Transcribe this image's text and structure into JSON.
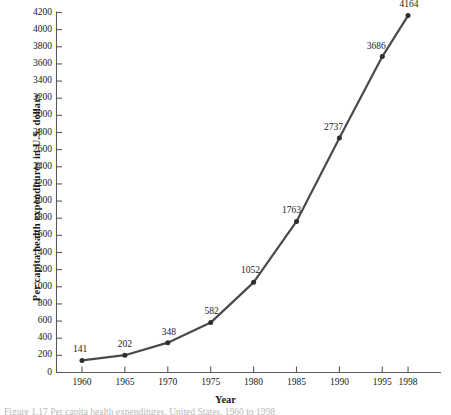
{
  "figure": {
    "caption": "Figure 1.17 Per capita health expenditures, United States, 1960 to 1998"
  },
  "chart_data": {
    "type": "line",
    "title": "",
    "xlabel": "Year",
    "ylabel": "Per capita health expenditures in U.S. dollars",
    "categories": [
      "1960",
      "1965",
      "1970",
      "1975",
      "1980",
      "1985",
      "1990",
      "1995",
      "1998"
    ],
    "x": [
      1960,
      1965,
      1970,
      1975,
      1980,
      1985,
      1990,
      1995,
      1998
    ],
    "values": [
      141,
      202,
      348,
      582,
      1052,
      1763,
      2737,
      3686,
      4164
    ],
    "point_labels": [
      "141",
      "202",
      "348",
      "582",
      "1052",
      "1763",
      "2737",
      "3686",
      "4164"
    ],
    "ylim": [
      0,
      4200
    ],
    "ytick_step": 200,
    "yticks": [
      "0",
      "200",
      "400",
      "600",
      "800",
      "1000",
      "1200",
      "1400",
      "1600",
      "1800",
      "2000",
      "2200",
      "2400",
      "2600",
      "2800",
      "3000",
      "3200",
      "3400",
      "3600",
      "3800",
      "4000",
      "4200"
    ],
    "ytick_values": [
      0,
      200,
      400,
      600,
      800,
      1000,
      1200,
      1400,
      1600,
      1800,
      2000,
      2200,
      2400,
      2600,
      2800,
      3000,
      3200,
      3400,
      3600,
      3800,
      4000,
      4200
    ],
    "grid": false,
    "legend": "none",
    "line_color": "#4a4a4a",
    "marker_color": "#2e2e2e",
    "axis_color": "#5a5a5a",
    "text_color": "#1a1a1a"
  }
}
